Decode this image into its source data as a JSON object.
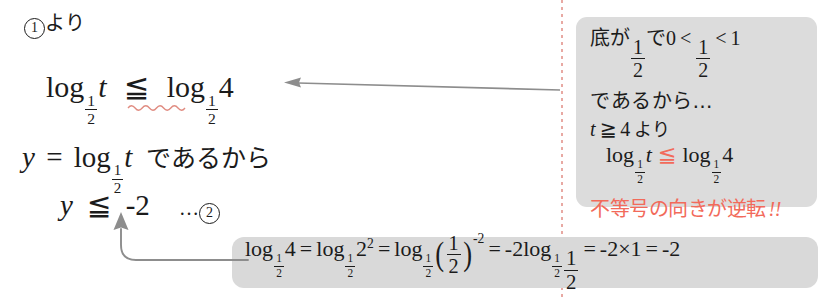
{
  "page": {
    "language": "ja",
    "background": "#ffffff",
    "box_fill": "#dcdcdc",
    "accent_red": "#f26a5a",
    "arrow_color": "#8a8a8a",
    "divider_color": "#e49a93"
  },
  "main_work": {
    "marker_label": "1",
    "marker_suffix": "より",
    "inequality": {
      "lhs_log": "log",
      "lhs_base_num": "1",
      "lhs_base_den": "2",
      "lhs_arg": "t",
      "relation": "≦",
      "rhs_log": "log",
      "rhs_base_num": "1",
      "rhs_base_den": "2",
      "rhs_arg": "4",
      "underline_style": "red-wavy"
    },
    "substitution": {
      "lhs": "y",
      "equals": "=",
      "log": "log",
      "base_num": "1",
      "base_den": "2",
      "arg": "t",
      "text": "であるから"
    },
    "result": {
      "lhs": "y",
      "relation": "≦",
      "rhs": "-2",
      "dots": "…",
      "ref_number": "2"
    }
  },
  "callout": {
    "line1": {
      "prefix": "底が",
      "frac_num": "1",
      "frac_den": "2",
      "mid": "で",
      "zero": "0",
      "lt1": "<",
      "frac2_num": "1",
      "frac2_den": "2",
      "lt2": "<",
      "one": "1"
    },
    "line2": "であるから…",
    "line3": {
      "var": "t",
      "relation": "≧",
      "value": "4",
      "suffix": "より"
    },
    "line4": {
      "log": "log",
      "base_num": "1",
      "base_den": "2",
      "arg": "t",
      "relation": "≦",
      "log2": "log",
      "base2_num": "1",
      "base2_den": "2",
      "arg2": "4"
    },
    "line5": "不等号の向きが逆転",
    "line5_bangs": "!!"
  },
  "bottom_box": {
    "term1": {
      "log": "log",
      "base_num": "1",
      "base_den": "2",
      "arg": "4"
    },
    "eq1": "=",
    "term2": {
      "log": "log",
      "base_num": "1",
      "base_den": "2",
      "arg": "2",
      "exp": "2"
    },
    "eq2": "=",
    "term3": {
      "log": "log",
      "base_num": "1",
      "base_den": "2",
      "inner_num": "1",
      "inner_den": "2",
      "exp": "-2"
    },
    "eq3": "=",
    "term4": {
      "coef": "-2",
      "log": "log",
      "base_num": "1",
      "base_den": "2",
      "arg_num": "1",
      "arg_den": "2"
    },
    "eq4": "=",
    "term5": "-2×1",
    "eq5": "=",
    "term6": "-2"
  },
  "arrows": {
    "callout_to_inequality": "left-arrow",
    "bottombox_to_result": "up-elbow-arrow"
  }
}
